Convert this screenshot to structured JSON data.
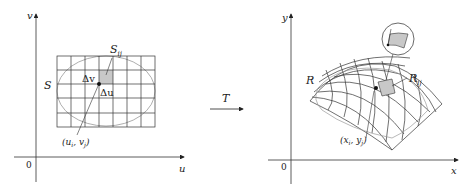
{
  "left_diagram": {
    "axis_horizontal_label": "u",
    "axis_vertical_label": "v",
    "origin_label": "0",
    "region_label": "S",
    "subrect_label": "S",
    "subrect_subscript": "ij",
    "delta_v_label": "Δv",
    "delta_u_label": "Δu",
    "point_label": "(u",
    "point_label_i": "i",
    "point_label_mid": ", v",
    "point_label_j": "j",
    "point_label_end": ")",
    "grid_columns": 7,
    "grid_rows": 5,
    "highlight_color": "#c8c8c8"
  },
  "transform": {
    "label": "T"
  },
  "right_diagram": {
    "axis_horizontal_label": "x",
    "axis_vertical_label": "y",
    "origin_label": "0",
    "region_label": "R",
    "subregion_label": "R",
    "subregion_subscript": "ij",
    "point_label": "(x",
    "point_label_i": "i",
    "point_label_mid": ", y",
    "point_label_j": "j",
    "point_label_end": ")",
    "highlight_color": "#c8c8c8"
  }
}
